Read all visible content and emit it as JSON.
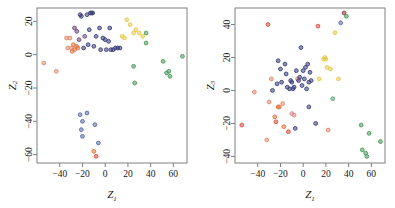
{
  "figure": {
    "panel_count": 2,
    "background": "#ffffff"
  },
  "palette": {
    "navy": "#3b3f7a",
    "purple": "#6b4a7d",
    "salmon": "#e08a6e",
    "red": "#d9503c",
    "orange": "#e8743c",
    "yellow": "#e8c84a",
    "gold": "#d8b43a",
    "green": "#4a9a5a",
    "teal": "#5aa87a",
    "steelblue": "#5b6aa8",
    "maroon": "#8a3a3a",
    "pink": "#d98a8a"
  },
  "chart_data": [
    {
      "type": "scatter",
      "panel": "left",
      "title": "",
      "xlabel": "Z",
      "xlabel_sub": "1",
      "ylabel": "Z",
      "ylabel_sub": "2",
      "xlim": [
        -60,
        72
      ],
      "ylim": [
        -65,
        28
      ],
      "xticks": [
        -40,
        -20,
        0,
        20,
        40,
        60
      ],
      "yticks": [
        20,
        0,
        -20,
        -40,
        -60
      ],
      "grid": false,
      "legend": "none",
      "points": [
        {
          "x": -54,
          "y": -5,
          "c": "salmon"
        },
        {
          "x": -43,
          "y": -10,
          "c": "salmon"
        },
        {
          "x": -34,
          "y": 10,
          "c": "salmon"
        },
        {
          "x": -33,
          "y": 4,
          "c": "salmon"
        },
        {
          "x": -31,
          "y": 10,
          "c": "salmon"
        },
        {
          "x": -30,
          "y": 4,
          "c": "salmon"
        },
        {
          "x": -29,
          "y": 2,
          "c": "orange"
        },
        {
          "x": -28,
          "y": 6,
          "c": "orange"
        },
        {
          "x": -27,
          "y": 3,
          "c": "orange"
        },
        {
          "x": -26,
          "y": 5,
          "c": "salmon"
        },
        {
          "x": -25,
          "y": 5,
          "c": "salmon"
        },
        {
          "x": -24,
          "y": 4,
          "c": "orange"
        },
        {
          "x": -27,
          "y": 16,
          "c": "purple"
        },
        {
          "x": -25,
          "y": 14,
          "c": "purple"
        },
        {
          "x": -23,
          "y": 9,
          "c": "purple"
        },
        {
          "x": -22,
          "y": 24,
          "c": "navy"
        },
        {
          "x": -21,
          "y": 23,
          "c": "navy"
        },
        {
          "x": -19,
          "y": 4,
          "c": "navy"
        },
        {
          "x": -18,
          "y": 11,
          "c": "purple"
        },
        {
          "x": -16,
          "y": 24,
          "c": "navy"
        },
        {
          "x": -15,
          "y": 6,
          "c": "navy"
        },
        {
          "x": -14,
          "y": 15,
          "c": "navy"
        },
        {
          "x": -13,
          "y": 25,
          "c": "navy"
        },
        {
          "x": -12,
          "y": 25,
          "c": "navy"
        },
        {
          "x": -11,
          "y": 25,
          "c": "navy"
        },
        {
          "x": -10,
          "y": 5,
          "c": "navy"
        },
        {
          "x": -8,
          "y": 11,
          "c": "navy"
        },
        {
          "x": -5,
          "y": 16,
          "c": "navy"
        },
        {
          "x": -4,
          "y": 3,
          "c": "navy"
        },
        {
          "x": -2,
          "y": 10,
          "c": "navy"
        },
        {
          "x": 0,
          "y": 9,
          "c": "navy"
        },
        {
          "x": 1,
          "y": 3,
          "c": "navy"
        },
        {
          "x": 3,
          "y": 8,
          "c": "navy"
        },
        {
          "x": 4,
          "y": 16,
          "c": "navy"
        },
        {
          "x": 5,
          "y": 3,
          "c": "navy"
        },
        {
          "x": 7,
          "y": 3,
          "c": "navy"
        },
        {
          "x": 9,
          "y": 4,
          "c": "navy"
        },
        {
          "x": 11,
          "y": 4,
          "c": "navy"
        },
        {
          "x": 13,
          "y": 4,
          "c": "navy"
        },
        {
          "x": 15,
          "y": 11,
          "c": "yellow"
        },
        {
          "x": 17,
          "y": 10,
          "c": "yellow"
        },
        {
          "x": 19,
          "y": 21,
          "c": "yellow"
        },
        {
          "x": 22,
          "y": 18,
          "c": "yellow"
        },
        {
          "x": 25,
          "y": 13,
          "c": "yellow"
        },
        {
          "x": 27,
          "y": 15,
          "c": "yellow"
        },
        {
          "x": 30,
          "y": 13,
          "c": "yellow"
        },
        {
          "x": 33,
          "y": 11,
          "c": "yellow"
        },
        {
          "x": 36,
          "y": 13,
          "c": "green"
        },
        {
          "x": 36,
          "y": 7,
          "c": "green"
        },
        {
          "x": 25,
          "y": -7,
          "c": "green"
        },
        {
          "x": 26,
          "y": -17,
          "c": "green"
        },
        {
          "x": 51,
          "y": -4,
          "c": "green"
        },
        {
          "x": 54,
          "y": -11,
          "c": "green"
        },
        {
          "x": 56,
          "y": -10,
          "c": "green"
        },
        {
          "x": 57,
          "y": -13,
          "c": "green"
        },
        {
          "x": 68,
          "y": -1,
          "c": "green"
        },
        {
          "x": -22,
          "y": -36,
          "c": "steelblue"
        },
        {
          "x": -16,
          "y": -35,
          "c": "steelblue"
        },
        {
          "x": -20,
          "y": -40,
          "c": "steelblue"
        },
        {
          "x": -21,
          "y": -45,
          "c": "steelblue"
        },
        {
          "x": -20,
          "y": -49,
          "c": "steelblue"
        },
        {
          "x": -9,
          "y": -42,
          "c": "steelblue"
        },
        {
          "x": -6,
          "y": -53,
          "c": "steelblue"
        },
        {
          "x": -10,
          "y": -58,
          "c": "orange"
        },
        {
          "x": -8,
          "y": -61,
          "c": "red"
        }
      ]
    },
    {
      "type": "scatter",
      "panel": "right",
      "title": "",
      "xlabel": "Z",
      "xlabel_sub": "1",
      "ylabel": "Z",
      "ylabel_sub": "3",
      "xlim": [
        -60,
        72
      ],
      "ylim": [
        -44,
        50
      ],
      "xticks": [
        -40,
        -20,
        0,
        20,
        40,
        60
      ],
      "yticks": [
        40,
        20,
        0,
        -20,
        -40
      ],
      "grid": false,
      "legend": "none",
      "points": [
        {
          "x": -54,
          "y": -21,
          "c": "red"
        },
        {
          "x": -43,
          "y": -1,
          "c": "salmon"
        },
        {
          "x": -32,
          "y": -30,
          "c": "salmon"
        },
        {
          "x": -31,
          "y": 40,
          "c": "red"
        },
        {
          "x": -30,
          "y": -7,
          "c": "salmon"
        },
        {
          "x": -28,
          "y": 7,
          "c": "salmon"
        },
        {
          "x": -27,
          "y": 0,
          "c": "navy"
        },
        {
          "x": -25,
          "y": -16,
          "c": "orange"
        },
        {
          "x": -24,
          "y": -19,
          "c": "red"
        },
        {
          "x": -23,
          "y": 4,
          "c": "navy"
        },
        {
          "x": -22,
          "y": -10,
          "c": "orange"
        },
        {
          "x": -21,
          "y": -10,
          "c": "orange"
        },
        {
          "x": -22,
          "y": 18,
          "c": "navy"
        },
        {
          "x": -20,
          "y": 13,
          "c": "navy"
        },
        {
          "x": -19,
          "y": 5,
          "c": "navy"
        },
        {
          "x": -18,
          "y": -8,
          "c": "salmon"
        },
        {
          "x": -17,
          "y": -22,
          "c": "orange"
        },
        {
          "x": -16,
          "y": 16,
          "c": "navy"
        },
        {
          "x": -15,
          "y": 10,
          "c": "navy"
        },
        {
          "x": -14,
          "y": 2,
          "c": "navy"
        },
        {
          "x": -13,
          "y": -25,
          "c": "red"
        },
        {
          "x": -12,
          "y": 1,
          "c": "navy"
        },
        {
          "x": -11,
          "y": 6,
          "c": "navy"
        },
        {
          "x": -10,
          "y": 5,
          "c": "navy"
        },
        {
          "x": -9,
          "y": 1,
          "c": "navy"
        },
        {
          "x": -8,
          "y": 2,
          "c": "navy"
        },
        {
          "x": -10,
          "y": -14,
          "c": "pink"
        },
        {
          "x": -8,
          "y": -15,
          "c": "pink"
        },
        {
          "x": -7,
          "y": -23,
          "c": "navy"
        },
        {
          "x": -6,
          "y": 12,
          "c": "navy"
        },
        {
          "x": -5,
          "y": 7,
          "c": "salmon"
        },
        {
          "x": -4,
          "y": 6,
          "c": "navy"
        },
        {
          "x": -3,
          "y": 8,
          "c": "navy"
        },
        {
          "x": -2,
          "y": 26,
          "c": "navy"
        },
        {
          "x": -1,
          "y": 3,
          "c": "navy"
        },
        {
          "x": 0,
          "y": 12,
          "c": "navy"
        },
        {
          "x": 1,
          "y": 7,
          "c": "navy"
        },
        {
          "x": 2,
          "y": 14,
          "c": "navy"
        },
        {
          "x": 3,
          "y": 1,
          "c": "navy"
        },
        {
          "x": 4,
          "y": 16,
          "c": "navy"
        },
        {
          "x": 5,
          "y": 5,
          "c": "navy"
        },
        {
          "x": 6,
          "y": 11,
          "c": "navy"
        },
        {
          "x": 7,
          "y": 6,
          "c": "navy"
        },
        {
          "x": 5,
          "y": -10,
          "c": "navy"
        },
        {
          "x": 11,
          "y": -20,
          "c": "navy"
        },
        {
          "x": 13,
          "y": 39,
          "c": "red"
        },
        {
          "x": 14,
          "y": 7,
          "c": "yellow"
        },
        {
          "x": 18,
          "y": 19,
          "c": "yellow"
        },
        {
          "x": 19,
          "y": 20,
          "c": "yellow"
        },
        {
          "x": 20,
          "y": 19,
          "c": "yellow"
        },
        {
          "x": 21,
          "y": 14,
          "c": "yellow"
        },
        {
          "x": 22,
          "y": -24,
          "c": "salmon"
        },
        {
          "x": 24,
          "y": 13,
          "c": "yellow"
        },
        {
          "x": 26,
          "y": -5,
          "c": "teal"
        },
        {
          "x": 28,
          "y": 35,
          "c": "yellow"
        },
        {
          "x": 31,
          "y": 7,
          "c": "yellow"
        },
        {
          "x": 33,
          "y": 41,
          "c": "steelblue"
        },
        {
          "x": 36,
          "y": 47,
          "c": "maroon"
        },
        {
          "x": 38,
          "y": 45,
          "c": "green"
        },
        {
          "x": 51,
          "y": -21,
          "c": "green"
        },
        {
          "x": 52,
          "y": -36,
          "c": "green"
        },
        {
          "x": 55,
          "y": -38,
          "c": "green"
        },
        {
          "x": 56,
          "y": -40,
          "c": "green"
        },
        {
          "x": 58,
          "y": -26,
          "c": "green"
        },
        {
          "x": 68,
          "y": -31,
          "c": "green"
        }
      ]
    }
  ]
}
